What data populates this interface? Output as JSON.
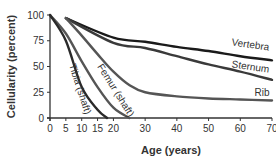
{
  "chart_data": {
    "type": "line",
    "title": "",
    "xlabel": "Age (years)",
    "ylabel": "Cellularity (percent)",
    "xlim": [
      0,
      70
    ],
    "ylim": [
      0,
      100
    ],
    "xticks": [
      0,
      5,
      10,
      15,
      20,
      30,
      40,
      50,
      60,
      70
    ],
    "yticks": [
      0,
      25,
      50,
      75,
      100
    ],
    "grid": false,
    "legend": "inline labels",
    "series": [
      {
        "name": "Vertebra",
        "color": "#1a1a1a",
        "x": [
          5,
          20,
          30,
          40,
          50,
          60,
          70
        ],
        "y": [
          97,
          78,
          74,
          69,
          65,
          60,
          56
        ]
      },
      {
        "name": "Sternum",
        "color": "#3a3a3a",
        "x": [
          5,
          20,
          30,
          40,
          50,
          60,
          70
        ],
        "y": [
          97,
          73,
          68,
          60,
          52,
          45,
          37
        ]
      },
      {
        "name": "Rib",
        "color": "#555555",
        "x": [
          5,
          10,
          15,
          20,
          25,
          30,
          40,
          50,
          60,
          70
        ],
        "y": [
          97,
          80,
          62,
          45,
          32,
          25,
          21,
          19,
          18,
          17
        ]
      },
      {
        "name": "Femur (shaft)",
        "color": "#555555",
        "x": [
          0,
          5,
          10,
          15,
          20,
          25
        ],
        "y": [
          100,
          82,
          55,
          30,
          10,
          0
        ]
      },
      {
        "name": "Tibia (shaft)",
        "color": "#2a2a2a",
        "x": [
          0,
          5,
          10,
          15,
          18
        ],
        "y": [
          100,
          75,
          30,
          8,
          0
        ]
      }
    ]
  }
}
